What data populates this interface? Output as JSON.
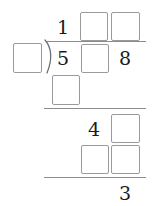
{
  "worksheet": {
    "type": "long-division",
    "quotient_row": {
      "cells": [
        {
          "kind": "digit",
          "value": "1"
        },
        {
          "kind": "box",
          "value": ""
        },
        {
          "kind": "box",
          "value": ""
        }
      ]
    },
    "divisor": {
      "kind": "box",
      "value": ""
    },
    "division_bracket": "division-bracket",
    "dividend_row": {
      "cells": [
        {
          "kind": "digit",
          "value": "5"
        },
        {
          "kind": "box",
          "value": ""
        },
        {
          "kind": "digit",
          "value": "8"
        }
      ]
    },
    "partial_product_row_1": {
      "cells": [
        {
          "kind": "box",
          "value": ""
        }
      ]
    },
    "bring_down_row": {
      "cells": [
        {
          "kind": "digit",
          "value": "4"
        },
        {
          "kind": "box",
          "value": ""
        }
      ]
    },
    "partial_product_row_2": {
      "cells": [
        {
          "kind": "box",
          "value": ""
        },
        {
          "kind": "box",
          "value": ""
        }
      ]
    },
    "remainder_row": {
      "cells": [
        {
          "kind": "digit",
          "value": "3"
        }
      ]
    }
  },
  "colors": {
    "box_border": "#9a9a9a",
    "rule": "#8c8c8c",
    "digit": "#1a1a1a",
    "background": "#ffffff"
  }
}
